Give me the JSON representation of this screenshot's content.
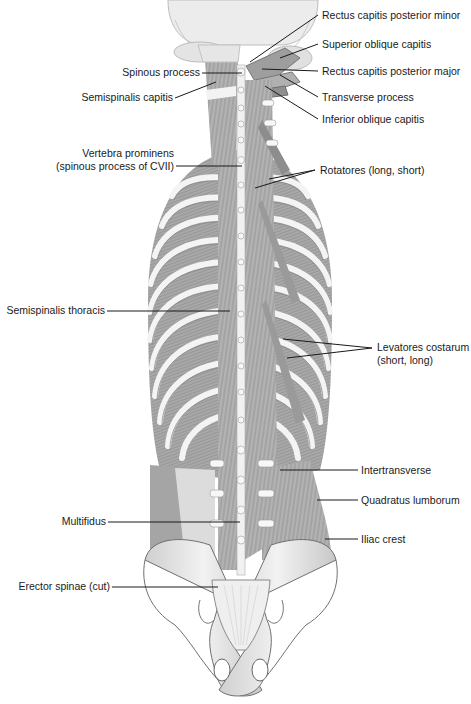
{
  "diagram": {
    "colors": {
      "background": "#ffffff",
      "label_text": "#1a1a1a",
      "leader_line": "#1a1a1a",
      "bone": "#e6e6e6",
      "bone_shadow": "#9a9a9a",
      "muscle": "#b5b5b5",
      "muscle_dark": "#7a7a7a"
    },
    "labels_left": [
      {
        "id": "spinous-process",
        "text": "Spinous process"
      },
      {
        "id": "semispinalis-capitis",
        "text": "Semispinalis capitis"
      },
      {
        "id": "vertebra-prominens",
        "line1": "Vertebra prominens",
        "line2": "(spinous process of CVII)"
      },
      {
        "id": "semispinalis-thoracis",
        "text": "Semispinalis thoracis"
      },
      {
        "id": "multifidus",
        "text": "Multifidus"
      },
      {
        "id": "erector-spinae",
        "text": "Erector spinae (cut)"
      }
    ],
    "labels_right": [
      {
        "id": "rectus-capitis-posterior-minor",
        "text": "Rectus capitis posterior minor"
      },
      {
        "id": "superior-oblique-capitis",
        "text": "Superior oblique capitis"
      },
      {
        "id": "rectus-capitis-posterior-major",
        "text": "Rectus capitis posterior major"
      },
      {
        "id": "transverse-process",
        "text": "Transverse process"
      },
      {
        "id": "inferior-oblique-capitis",
        "text": "Inferior oblique capitis"
      },
      {
        "id": "rotatores",
        "text": "Rotatores (long, short)"
      },
      {
        "id": "levatores-costarum",
        "line1": "Levatores costarum",
        "line2": "(short, long)"
      },
      {
        "id": "intertransverse",
        "text": "Intertransverse"
      },
      {
        "id": "quadratus-lumborum",
        "text": "Quadratus lumborum"
      },
      {
        "id": "iliac-crest",
        "text": "Iliac crest"
      }
    ]
  }
}
